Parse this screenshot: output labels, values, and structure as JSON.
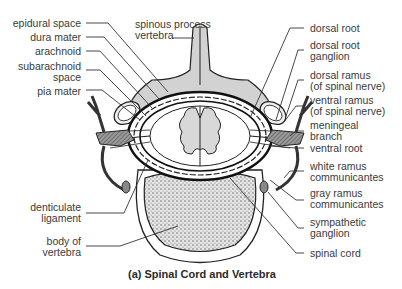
{
  "figure": {
    "caption": "(a) Spinal Cord and Vertebra",
    "labels_left": [
      {
        "id": "epidural-space",
        "line1": "epidural space",
        "line2": ""
      },
      {
        "id": "dura-mater",
        "line1": "dura mater",
        "line2": ""
      },
      {
        "id": "arachnoid",
        "line1": "arachnoid",
        "line2": ""
      },
      {
        "id": "subarachnoid-space",
        "line1": "subarachnoid",
        "line2": "space"
      },
      {
        "id": "pia-mater",
        "line1": "pia mater",
        "line2": ""
      },
      {
        "id": "denticulate-ligament",
        "line1": "denticulate",
        "line2": "ligament"
      },
      {
        "id": "body-of-vertebra",
        "line1": "body of",
        "line2": "vertebra"
      }
    ],
    "labels_top": [
      {
        "id": "spinous-process",
        "line1": "spinous process",
        "line2": "vertebra"
      }
    ],
    "labels_right": [
      {
        "id": "dorsal-root",
        "line1": "dorsal root",
        "line2": ""
      },
      {
        "id": "dorsal-root-ganglion",
        "line1": "dorsal root",
        "line2": "ganglion"
      },
      {
        "id": "dorsal-ramus",
        "line1": "dorsal ramus",
        "line2": "(of spinal nerve)"
      },
      {
        "id": "ventral-ramus",
        "line1": "ventral ramus",
        "line2": "(of spinal nerve)"
      },
      {
        "id": "meningeal-branch",
        "line1": "meningeal",
        "line2": "branch"
      },
      {
        "id": "ventral-root",
        "line1": "ventral root",
        "line2": ""
      },
      {
        "id": "white-ramus",
        "line1": "white ramus",
        "line2": "communicantes"
      },
      {
        "id": "gray-ramus",
        "line1": "gray ramus",
        "line2": "communicantes"
      },
      {
        "id": "sympathetic-ganglion",
        "line1": "sympathetic",
        "line2": "ganglion"
      },
      {
        "id": "spinal-cord",
        "line1": "spinal cord",
        "line2": ""
      }
    ]
  }
}
